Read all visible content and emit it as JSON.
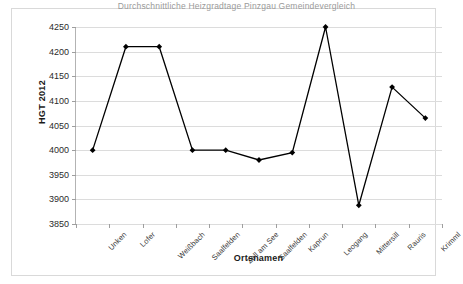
{
  "chart_data": {
    "type": "line",
    "title": "",
    "clipped_top_text": "Durchschnittliche Heizgradtage Pinzgau Gemeindevergleich",
    "xlabel": "Ortsnamen",
    "ylabel": "HGT 2012",
    "categories": [
      "Unken",
      "Lofer",
      "Weißbach",
      "Saalfelden",
      "Zell am See",
      "Saalfelden",
      "Kaprun",
      "Leogang",
      "Mittersill",
      "Rauris",
      "Krimml"
    ],
    "values": [
      4000,
      4210,
      4210,
      4000,
      4000,
      3980,
      3995,
      4250,
      3888,
      4128,
      4065
    ],
    "ylim": [
      3850,
      4250
    ],
    "ytick_step": 50,
    "yticks": [
      4250,
      4200,
      4150,
      4100,
      4050,
      4000,
      3950,
      3900,
      3850
    ],
    "grid": true,
    "legend": "none",
    "series_color": "#000000",
    "marker": "diamond",
    "gridline_color": "#dcdcdc",
    "axis_color": "#b3b3b3",
    "frame_color": "#d9d9d9"
  }
}
